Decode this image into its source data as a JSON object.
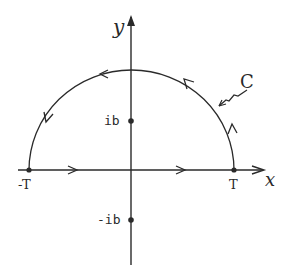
{
  "diagram": {
    "type": "contour-integral-diagram",
    "stroke_color": "#2a2a2a",
    "background": "#ffffff",
    "axes": {
      "x_label": "x",
      "y_label": "y"
    },
    "points": [
      {
        "id": "neg_T",
        "label": "-T",
        "on": "real-axis"
      },
      {
        "id": "T",
        "label": "T",
        "on": "real-axis"
      },
      {
        "id": "ib",
        "label": "ib",
        "on": "imaginary-axis"
      },
      {
        "id": "neg_ib",
        "label": "-ib",
        "on": "imaginary-axis"
      }
    ],
    "contour": {
      "label": "C",
      "shape": "upper semicircle closed by segment [-T, T]",
      "orientation": "counterclockwise"
    }
  }
}
